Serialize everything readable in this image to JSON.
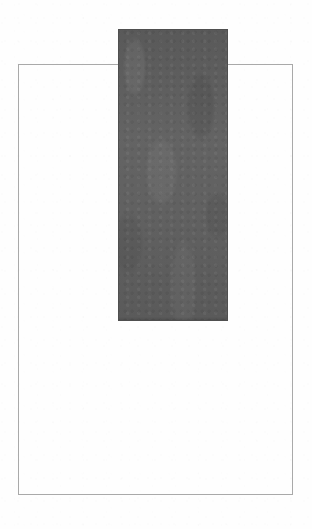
{
  "artwork": {
    "title": "Untitled Geometric Composition",
    "medium": "Ink on paper",
    "background_color": "#fefefe",
    "canvas": {
      "width": 312,
      "height": 529
    }
  },
  "shapes": {
    "outline_rectangle": {
      "name": "Outlined rectangle",
      "fill": "none",
      "stroke_color": "#a9a9a9",
      "stroke_width": 1,
      "x": 18,
      "y": 64,
      "width": 275,
      "height": 431
    },
    "filled_rectangle": {
      "name": "Dark filled bar",
      "fill_color": "#5e5e5e",
      "stroke_color": "#4f4f4f",
      "stroke_width": 1,
      "x": 118,
      "y": 29,
      "width": 110,
      "height": 292
    }
  },
  "chart_data": {
    "type": "bar",
    "title": "",
    "subtitle": "",
    "xlabel": "",
    "ylabel": "",
    "categories": [
      "bar-1"
    ],
    "values": [
      292
    ],
    "colors": [
      "#5e5e5e"
    ],
    "xlim": [
      18,
      293
    ],
    "ylim": [
      29,
      495
    ],
    "grid": false,
    "legend": "none",
    "annotations": []
  }
}
